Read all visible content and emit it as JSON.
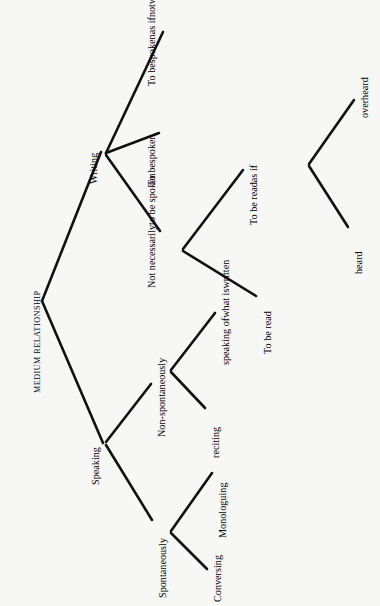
{
  "diagram": {
    "kind": "tree-diagram",
    "orientation": "rotated-90-ccw",
    "background_color": "#f7f7f6",
    "line_color": "#111111",
    "text_color": "#151515",
    "root": {
      "id": "medium-relationship",
      "label": "MEDIUM RELATIONSHIP"
    },
    "nodes": {
      "writing": {
        "label": "Writing"
      },
      "speaking": {
        "label": "Speaking"
      },
      "to_be_spoken_as_if_not_written": {
        "lines": [
          "To be",
          "spoken",
          "as if",
          "not",
          "written"
        ]
      },
      "to_be_spoken": {
        "lines": [
          "To be",
          "spoken"
        ]
      },
      "not_necessarily_to_be_spoken": {
        "lines": [
          "Not necessarily",
          "to be spoken"
        ]
      },
      "to_be_read_as_if": {
        "lines": [
          "To be read",
          "as if"
        ]
      },
      "overheard": {
        "label": "overheard"
      },
      "heard": {
        "label": "heard"
      },
      "to_be_read": {
        "label": "To be read"
      },
      "non_spontaneously": {
        "label": "Non-spontaneously"
      },
      "speaking_of_what_is_written": {
        "lines": [
          "speaking of",
          "what is",
          "written"
        ]
      },
      "reciting": {
        "label": "reciting"
      },
      "spontaneously": {
        "label": "Spontaneously"
      },
      "monologuing": {
        "label": "Monologuing"
      },
      "conversing": {
        "label": "Conversing"
      }
    },
    "edges": [
      {
        "from": "medium-relationship",
        "to": "writing"
      },
      {
        "from": "medium-relationship",
        "to": "speaking"
      },
      {
        "from": "writing",
        "to": "to_be_spoken_as_if_not_written"
      },
      {
        "from": "writing",
        "to": "to_be_spoken"
      },
      {
        "from": "writing",
        "to": "not_necessarily_to_be_spoken"
      },
      {
        "from": "not_necessarily_to_be_spoken",
        "to": "to_be_read_as_if"
      },
      {
        "from": "not_necessarily_to_be_spoken",
        "to": "to_be_read"
      },
      {
        "from": "to_be_read_as_if",
        "to": "overheard"
      },
      {
        "from": "to_be_read_as_if",
        "to": "heard"
      },
      {
        "from": "speaking",
        "to": "non_spontaneously"
      },
      {
        "from": "speaking",
        "to": "spontaneously"
      },
      {
        "from": "non_spontaneously",
        "to": "speaking_of_what_is_written"
      },
      {
        "from": "non_spontaneously",
        "to": "reciting"
      },
      {
        "from": "spontaneously",
        "to": "monologuing"
      },
      {
        "from": "spontaneously",
        "to": "conversing"
      }
    ]
  }
}
